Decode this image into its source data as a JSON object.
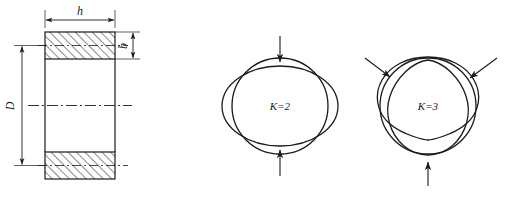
{
  "figure": {
    "stroke_color": "#1a1a1a",
    "hatch_color": "#2a2a2a",
    "background": "#ffffff"
  },
  "section_view": {
    "name": "ring-cross-section",
    "dimensions": {
      "width_label": "h",
      "thickness_label": "b",
      "diameter_label": "D"
    },
    "hatch_angle_deg": 45,
    "centerline_style": "dash-dot"
  },
  "modes": [
    {
      "id": "mode-k2",
      "label": "K=2",
      "lobes": 2,
      "arrow_count": 2,
      "arrow_angles_deg": [
        90,
        270
      ],
      "description": "Oval (two-lobe) deformation"
    },
    {
      "id": "mode-k3",
      "label": "K=3",
      "lobes": 3,
      "arrow_count": 3,
      "arrow_angles_deg": [
        150,
        30,
        270
      ],
      "description": "Trilobe (three-lobe) deformation"
    }
  ]
}
